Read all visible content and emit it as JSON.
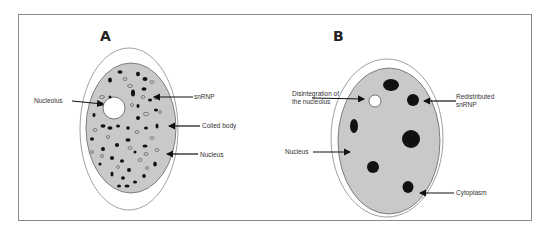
{
  "figure": {
    "panels": [
      {
        "id": "A",
        "label": "A",
        "annotations": {
          "nucleolus": "Nucleolus",
          "snrnp": "snRNP",
          "coiled_body": "Coiled body",
          "nucleus": "Nucleus"
        }
      },
      {
        "id": "B",
        "label": "B",
        "annotations": {
          "disintegration_line1": "Disintegration of",
          "disintegration_line2": "the nucleolus",
          "redistributed_line1": "Redistributed",
          "redistributed_line2": "snRNP",
          "nucleus": "Nucleus",
          "cytoplasm": "Cytoplasm"
        }
      }
    ],
    "colors": {
      "nucleus_fill": "#c9c9c9",
      "outline": "#555555",
      "speckle": "#111111",
      "background": "#ffffff"
    }
  }
}
